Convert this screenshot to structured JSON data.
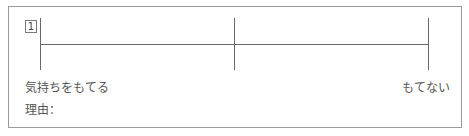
{
  "item": {
    "number": "1",
    "scale": {
      "left_label": "気持ちをもてる",
      "right_label": "もてない",
      "ticks": 3
    },
    "reason_label": "理由："
  }
}
